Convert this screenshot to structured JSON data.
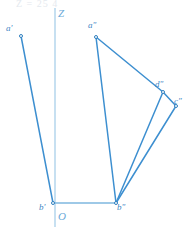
{
  "figure": {
    "title_ghost": "Z = 25 4",
    "axis": {
      "z_label": "Z",
      "origin_label": "O"
    },
    "colors": {
      "line": "#3d8fd0",
      "line_dark": "#2f7fbf",
      "axis": "#8fc1e3",
      "ground": "#7fb8e0",
      "label": "#3f86c4",
      "axis_label": "#6aa9d8",
      "ghost": "#cfd8e2",
      "background": "#ffffff"
    },
    "points": [
      {
        "id": "a-prime",
        "label": "a'",
        "x": 21,
        "y": 36,
        "label_x": 6,
        "label_y": 24
      },
      {
        "id": "b-prime",
        "label": "b'",
        "x": 53,
        "y": 203,
        "label_x": 39,
        "label_y": 203
      },
      {
        "id": "a-double-prime",
        "label": "a\"",
        "x": 96,
        "y": 37,
        "label_x": 88,
        "label_y": 21
      },
      {
        "id": "b-double-prime",
        "label": "b\"",
        "x": 116,
        "y": 203,
        "label_x": 117,
        "label_y": 203
      },
      {
        "id": "d-double-prime",
        "label": "d\"",
        "x": 163,
        "y": 92,
        "label_x": 155,
        "label_y": 80
      },
      {
        "id": "c-double-prime",
        "label": "c\"",
        "x": 176,
        "y": 106,
        "label_x": 174,
        "label_y": 97
      }
    ],
    "segments": [
      {
        "id": "seg-a-prime-b-prime",
        "from": "a-prime",
        "to": "b-prime",
        "width": 1.5
      },
      {
        "id": "seg-a-double-prime-b-double-prime",
        "from": "a-double-prime",
        "to": "b-double-prime",
        "width": 1.5
      },
      {
        "id": "seg-a-double-prime-d-double-prime",
        "from": "a-double-prime",
        "to": "d-double-prime",
        "width": 1.5
      },
      {
        "id": "seg-d-double-prime-c-double-prime",
        "from": "d-double-prime",
        "to": "c-double-prime",
        "width": 1.5
      },
      {
        "id": "seg-d-double-prime-b-double-prime",
        "from": "d-double-prime",
        "to": "b-double-prime",
        "width": 1.5
      },
      {
        "id": "seg-c-double-prime-b-double-prime",
        "from": "c-double-prime",
        "to": "b-double-prime",
        "width": 1.5
      }
    ],
    "ground_line": {
      "x1": 53,
      "y1": 203,
      "x2": 117,
      "y2": 203
    },
    "z_axis": {
      "x1": 55,
      "y1": 8,
      "x2": 55,
      "y2": 227
    },
    "z_label_pos": {
      "x": 58,
      "y": 8
    },
    "origin_label_pos": {
      "x": 58,
      "y": 211
    }
  }
}
